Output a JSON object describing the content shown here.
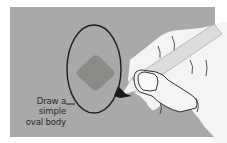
{
  "illustration": {
    "subject": "hand drawing an oval with a pencil",
    "caption_lines": [
      "Draw a",
      "simple",
      "oval body"
    ],
    "colors": {
      "panel": "#a9a9a9",
      "diamond": "#8c8a87",
      "outline": "#1e1e1e",
      "hand": "#f4f4f4",
      "pencil": "#dcdcdc"
    },
    "icons": {
      "hand": "hand-icon",
      "pencil": "pencil-icon",
      "oval": "oval-shape",
      "diamond": "diamond-shape"
    }
  }
}
